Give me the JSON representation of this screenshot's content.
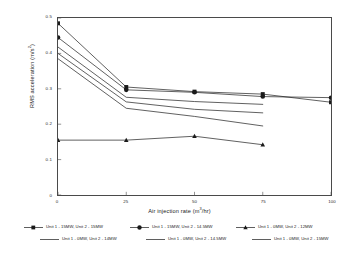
{
  "chart_data": {
    "type": "line",
    "title": "",
    "xlabel": "Air injection rate (m3/hr)",
    "xlabel_base": "Air injection rate (m",
    "xlabel_sup": "3",
    "xlabel_tail": "/hr)",
    "ylabel": "RMS acceleration (m/s2)",
    "ylabel_base": "RMS acceleration (m/s",
    "ylabel_sup": "2",
    "ylabel_tail": ")",
    "x": [
      0,
      25,
      50,
      75,
      100
    ],
    "xlim": [
      0,
      100
    ],
    "ylim": [
      0,
      0.5
    ],
    "xticks": [
      "0",
      "25",
      "50",
      "75",
      "100"
    ],
    "yticks": [
      "0",
      "0.1",
      "0.2",
      "0.3",
      "0.4",
      "0.5"
    ],
    "ytick_values": [
      0,
      0.1,
      0.2,
      0.3,
      0.4,
      0.5
    ],
    "grid": false,
    "legend_position": "below",
    "series": [
      {
        "name": "Unit 1 - 15MW, Unit 2 - 15MW",
        "marker": "square",
        "x": [
          0,
          25,
          50,
          75,
          100
        ],
        "values": [
          0.485,
          0.305,
          0.292,
          0.285,
          0.262
        ],
        "color": "#1a1a1a"
      },
      {
        "name": "Unit 1 - 15MW, Unit 2 - 14.5MW",
        "marker": "circle",
        "x": [
          0,
          25,
          50,
          75,
          100
        ],
        "values": [
          0.445,
          0.297,
          0.29,
          0.278,
          0.275
        ],
        "color": "#1a1a1a"
      },
      {
        "name": "Unit 1 - 0MW, Unit 2 - 12MW",
        "marker": "triangle",
        "x": [
          0,
          25,
          50,
          75
        ],
        "values": [
          0.155,
          0.155,
          0.166,
          0.142
        ],
        "color": "#1a1a1a"
      },
      {
        "name": "Unit 1 - 0MW, Unit 2 - 14MW",
        "marker": "none",
        "x": [
          0,
          25,
          50,
          75
        ],
        "values": [
          0.418,
          0.276,
          0.264,
          0.256
        ],
        "color": "#1a1a1a"
      },
      {
        "name": "Unit 1 - 0MW, Unit 2 - 14.5MW",
        "marker": "none",
        "x": [
          0,
          25,
          50,
          75
        ],
        "values": [
          0.4,
          0.263,
          0.242,
          0.232
        ],
        "color": "#1a1a1a"
      },
      {
        "name": "Unit 1 - 0MW, Unit 2 - 15MW",
        "marker": "none",
        "x": [
          0,
          25,
          50,
          75
        ],
        "values": [
          0.385,
          0.245,
          0.222,
          0.195
        ],
        "color": "#1a1a1a"
      }
    ]
  },
  "legend": {
    "row1": [
      {
        "label": "Unit 1 - 15MW, Unit 2 - 15MW",
        "marker": "square"
      },
      {
        "label": "Unit 1 - 15MW, Unit 2 - 14.5MW",
        "marker": "circle"
      },
      {
        "label": "Unit 1 - 0MW, Unit 2 - 12MW",
        "marker": "triangle"
      }
    ],
    "row2": [
      {
        "label": "Unit 1 - 0MW, Unit 2 - 14MW",
        "marker": "none"
      },
      {
        "label": "Unit 1 - 0MW, Unit 2 - 14.5MW",
        "marker": "none"
      },
      {
        "label": "Unit 1 - 0MW, Unit 2 - 15MW",
        "marker": "none"
      }
    ]
  },
  "style": {
    "line_color": "#1a1a1a",
    "frame_color": "#4a4a4a",
    "background": "#ffffff"
  }
}
